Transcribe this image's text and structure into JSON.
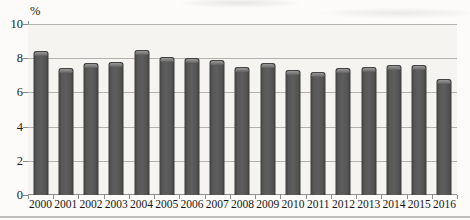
{
  "chart_data": {
    "type": "bar",
    "title": "",
    "ylabel": "%",
    "xlabel": "",
    "categories": [
      "2000",
      "2001",
      "2002",
      "2003",
      "2004",
      "2005",
      "2006",
      "2007",
      "2008",
      "2009",
      "2010",
      "2011",
      "2012",
      "2013",
      "2014",
      "2015",
      "2016"
    ],
    "values": [
      8.4,
      7.4,
      7.7,
      7.8,
      8.5,
      8.1,
      8.0,
      7.9,
      7.5,
      7.7,
      7.3,
      7.2,
      7.4,
      7.5,
      7.6,
      7.6,
      6.8
    ],
    "ylim": [
      0,
      10
    ],
    "yticks": [
      0,
      2,
      4,
      6,
      8,
      10
    ],
    "grid": "horizontal",
    "legend": "none",
    "colors": {
      "bar": "#525252",
      "bar_cap_highlight": "#8d8d8d",
      "gridline": "#b3b2af",
      "axis": "#8a8a8a",
      "text": "#1c1c1c",
      "plot_background": "#f5f4f1",
      "page_background": "#fcfbf9",
      "bottom_rule": "#aeadaa"
    }
  }
}
